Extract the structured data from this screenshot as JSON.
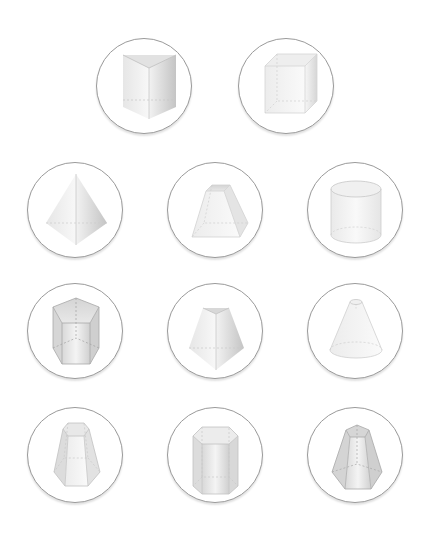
{
  "figure": {
    "shapes": [
      {
        "id": "triangular-prism",
        "label": "Triangular prism",
        "row": 1,
        "col": 1
      },
      {
        "id": "rectangular-prism",
        "label": "Rectangular prism",
        "row": 1,
        "col": 2
      },
      {
        "id": "triangular-pyramid",
        "label": "Triangular pyramid",
        "row": 2,
        "col": 1
      },
      {
        "id": "square-frustum",
        "label": "Square frustum",
        "row": 2,
        "col": 2
      },
      {
        "id": "cylinder",
        "label": "Cylinder",
        "row": 2,
        "col": 3
      },
      {
        "id": "pentagonal-prism",
        "label": "Pentagonal prism",
        "row": 3,
        "col": 1
      },
      {
        "id": "triangular-frustum",
        "label": "Triangular frustum",
        "row": 3,
        "col": 2
      },
      {
        "id": "conical-frustum",
        "label": "Conical frustum",
        "row": 3,
        "col": 3
      },
      {
        "id": "hexagonal-frustum",
        "label": "Hexagonal frustum",
        "row": 4,
        "col": 1
      },
      {
        "id": "hexagonal-prism",
        "label": "Hexagonal prism",
        "row": 4,
        "col": 2
      },
      {
        "id": "pentagonal-frustum",
        "label": "Pentagonal frustum",
        "row": 4,
        "col": 3
      }
    ],
    "colors": {
      "circle_border": "#9a9a9a",
      "shape_edge": "#bdbdbd",
      "shape_fill_light": "#f4f4f4",
      "shape_fill_dark": "#c8c8c8"
    }
  }
}
